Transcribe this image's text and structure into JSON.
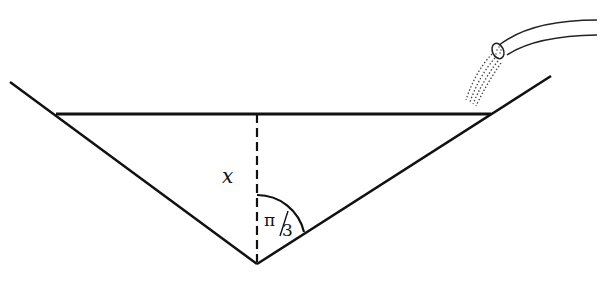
{
  "diagram": {
    "labels": {
      "depth": "x",
      "angle_num": "π",
      "angle_den": "3"
    },
    "colors": {
      "stroke": "#111111",
      "background": "#ffffff"
    }
  }
}
